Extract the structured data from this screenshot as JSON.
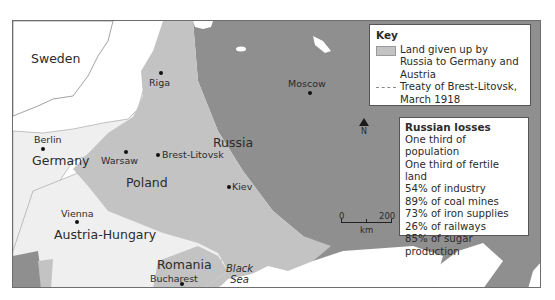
{
  "map": {
    "colors": {
      "sea": "#ffffff",
      "other_land": "#ececec",
      "ceded_land": "#c3c3c3",
      "russia": "#8f8f8f",
      "border": "#6e6e6e"
    },
    "countries": {
      "sweden": "Sweden",
      "germany": "Germany",
      "poland": "Poland",
      "russia": "Russia",
      "austria_hungary": "Austria-Hungary",
      "romania": "Romania"
    },
    "cities": {
      "riga": "Riga",
      "moscow": "Moscow",
      "berlin": "Berlin",
      "warsaw": "Warsaw",
      "brest_litovsk": "Brest-Litovsk",
      "kiev": "Kiev",
      "vienna": "Vienna",
      "bucharest": "Bucharest"
    },
    "seas": {
      "black_sea_line1": "Black",
      "black_sea_line2": "Sea"
    },
    "north_label": "N",
    "scale": {
      "start": "0",
      "end": "200",
      "unit": "km"
    }
  },
  "key": {
    "title": "Key",
    "items": [
      {
        "symbol": "grey-swatch",
        "label": "Land given up by Russia to Germany and Austria"
      },
      {
        "symbol": "dashed-line",
        "label": "Treaty of Brest-Litovsk, March 1918"
      }
    ]
  },
  "losses": {
    "title": "Russian losses",
    "items": [
      "One third of population",
      "One third of fertile land",
      "54% of industry",
      "89% of coal mines",
      "73% of iron supplies",
      "26% of railways",
      "85% of sugar production"
    ]
  }
}
